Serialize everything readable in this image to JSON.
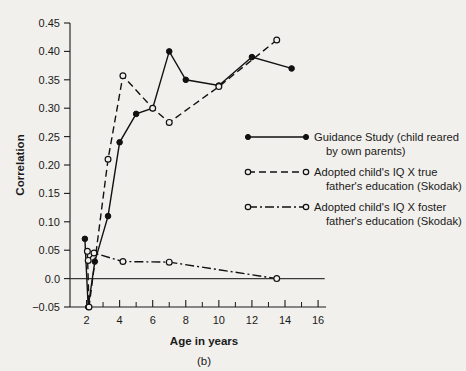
{
  "chart_data": {
    "type": "line",
    "title": "",
    "panel_label": "(b)",
    "xlabel": "Age in years",
    "ylabel": "Correlation",
    "xlim": [
      1.0,
      16.6
    ],
    "ylim": [
      -0.05,
      0.45
    ],
    "grid": false,
    "legend_position": "right",
    "x_ticks": [
      2,
      4,
      6,
      8,
      10,
      12,
      14,
      16
    ],
    "x_tick_labels": [
      "2",
      "4",
      "6",
      "8",
      "10",
      "12",
      "14",
      "16"
    ],
    "x_minor_ticks": [
      3,
      5,
      7,
      9,
      11,
      13,
      15
    ],
    "y_ticks": [
      -0.05,
      0.0,
      0.05,
      0.1,
      0.15,
      0.2,
      0.25,
      0.3,
      0.35,
      0.4,
      0.45
    ],
    "y_tick_labels": [
      "−0.05",
      "0.0",
      "0.05",
      "0.10",
      "0.15",
      "0.20",
      "0.25",
      "0.30",
      "0.35",
      "0.40",
      "0.45"
    ],
    "reference_line_y": 0.0,
    "series": [
      {
        "name": "Guidance Study (child reared by own parents)",
        "style": "solid",
        "marker": "filled-circle",
        "x": [
          1.9,
          2.1,
          2.5,
          3.3,
          4.0,
          5.0,
          6.0,
          7.0,
          8.0,
          10.0,
          12.0,
          14.4
        ],
        "values": [
          0.07,
          -0.05,
          0.03,
          0.11,
          0.24,
          0.29,
          0.3,
          0.4,
          0.35,
          0.34,
          0.39,
          0.37
        ]
      },
      {
        "name": "Adopted child's IQ X true father's education (Skodak)",
        "style": "dashed",
        "marker": "open-circle",
        "x": [
          2.05,
          2.15,
          3.3,
          4.2,
          6.0,
          7.0,
          10.0,
          13.5
        ],
        "values": [
          0.048,
          -0.05,
          0.21,
          0.357,
          0.3,
          0.275,
          0.338,
          0.42
        ]
      },
      {
        "name": "Adopted child's IQ X foster father's education (Skodak)",
        "style": "dashdot",
        "marker": "open-circle",
        "x": [
          2.1,
          2.45,
          4.2,
          7.0,
          13.5
        ],
        "values": [
          0.032,
          0.045,
          0.03,
          0.029,
          0.0
        ]
      }
    ],
    "legend": [
      {
        "style": "solid",
        "marker": "filled-circle",
        "line1": "Guidance Study (child reared",
        "line2": "by own parents)"
      },
      {
        "style": "dashed",
        "marker": "open-circle",
        "line1": "Adopted child's IQ X true",
        "line2": "father's education  (Skodak)"
      },
      {
        "style": "dashdot",
        "marker": "open-circle",
        "line1": "Adopted child's IQ X foster",
        "line2": "father's education  (Skodak)"
      }
    ]
  }
}
